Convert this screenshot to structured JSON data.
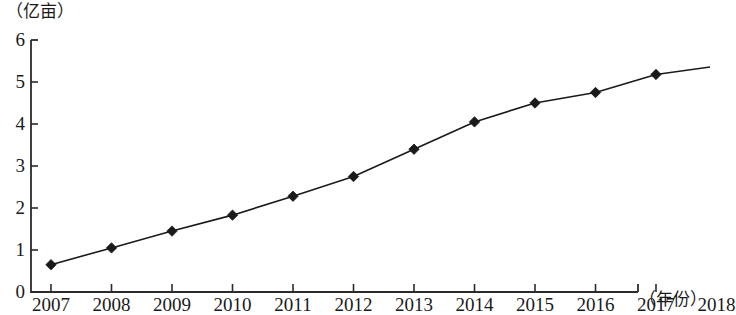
{
  "chart_data": {
    "type": "line",
    "title": "",
    "subtitle": "",
    "xlabel": "（年份）",
    "ylabel": "（亿亩）",
    "categories": [
      "2007",
      "2008",
      "2009",
      "2010",
      "2011",
      "2012",
      "2013",
      "2014",
      "2015",
      "2016",
      "2017",
      "2018"
    ],
    "values": [
      0.65,
      1.05,
      1.45,
      1.83,
      2.28,
      2.75,
      3.4,
      4.05,
      4.5,
      4.75,
      5.18,
      5.38
    ],
    "series": [
      {
        "name": "",
        "values": [
          0.65,
          1.05,
          1.45,
          1.83,
          2.28,
          2.75,
          3.4,
          4.05,
          4.5,
          4.75,
          5.18,
          5.38
        ]
      }
    ],
    "xlim": [
      2007,
      2018
    ],
    "ylim": [
      0,
      6
    ],
    "ytick_labels": [
      "0",
      "1",
      "2",
      "3",
      "4",
      "5",
      "6"
    ],
    "ytick_values": [
      0,
      1,
      2,
      3,
      4,
      5,
      6
    ],
    "xtick_labels": [
      "2007",
      "2008",
      "2009",
      "2010",
      "2011",
      "2012",
      "2013",
      "2014",
      "2015",
      "2016",
      "2017",
      "2018"
    ],
    "grid": false,
    "legend": false,
    "legend_position": "none",
    "marker": "diamond",
    "line_color": "#1a1a1a",
    "marker_color": "#1a1a1a",
    "axis_color": "#2b2b2b",
    "background_color": "#ffffff",
    "annotations": []
  },
  "axis": {
    "y_unit": "（亿亩）",
    "x_name": "（年份）"
  }
}
